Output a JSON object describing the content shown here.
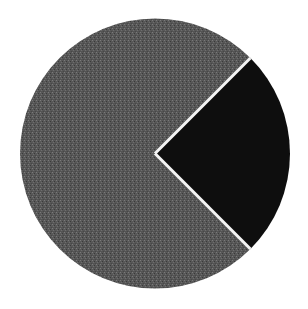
{
  "chart_data": {
    "type": "pie",
    "title": "",
    "labels": [
      "Slice A",
      "Slice B"
    ],
    "values": [
      75,
      25
    ],
    "colors": [
      "#585858",
      "#0e0e0e"
    ],
    "start_angle_deg": 45,
    "direction": "clockwise",
    "legend": "none",
    "separator_color": "#f4f4f4",
    "center": [
      155,
      153.5
    ],
    "radius": 135
  }
}
